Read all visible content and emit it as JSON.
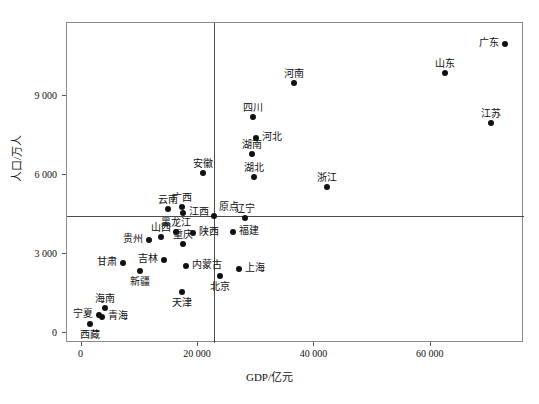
{
  "chart_data": {
    "type": "scatter",
    "title": "",
    "xlabel": "GDP/亿元",
    "ylabel": "人口/万人",
    "xlim": [
      -2500,
      76000
    ],
    "ylim": [
      -400,
      11800
    ],
    "xticks": [
      0,
      20000,
      40000,
      60000
    ],
    "xticklabels": [
      "0",
      "20 000",
      "40 000",
      "60 000"
    ],
    "yticks": [
      0,
      3000,
      6000,
      9000
    ],
    "yticklabels": [
      "0",
      "3 000",
      "6 000",
      "9 000"
    ],
    "grid": false,
    "legend": null,
    "reference_lines": {
      "vertical_x": 22800,
      "horizontal_y": 4450,
      "origin_label": "原点"
    },
    "points": [
      {
        "name": "广东",
        "x": 72800,
        "y": 11000,
        "label_pos": "left"
      },
      {
        "name": "山东",
        "x": 62500,
        "y": 9880,
        "label_pos": "top"
      },
      {
        "name": "江苏",
        "x": 70400,
        "y": 7990,
        "label_pos": "top"
      },
      {
        "name": "河南",
        "x": 36500,
        "y": 9520,
        "label_pos": "top"
      },
      {
        "name": "四川",
        "x": 29500,
        "y": 8220,
        "label_pos": "top"
      },
      {
        "name": "河北",
        "x": 29900,
        "y": 7400,
        "label_pos": "right"
      },
      {
        "name": "湖南",
        "x": 29300,
        "y": 6820,
        "label_pos": "top"
      },
      {
        "name": "湖北",
        "x": 29600,
        "y": 5920,
        "label_pos": "top"
      },
      {
        "name": "浙江",
        "x": 42200,
        "y": 5540,
        "label_pos": "top"
      },
      {
        "name": "安徽",
        "x": 20800,
        "y": 6100,
        "label_pos": "top"
      },
      {
        "name": "云南",
        "x": 14800,
        "y": 4710,
        "label_pos": "top"
      },
      {
        "name": "广西",
        "x": 17200,
        "y": 4800,
        "label_pos": "top"
      },
      {
        "name": "江西",
        "x": 17400,
        "y": 4560,
        "label_pos": "right"
      },
      {
        "name": "辽宁",
        "x": 28000,
        "y": 4380,
        "label_pos": "top"
      },
      {
        "name": "福建",
        "x": 26000,
        "y": 3840,
        "label_pos": "right"
      },
      {
        "name": "陕西",
        "x": 19200,
        "y": 3810,
        "label_pos": "right"
      },
      {
        "name": "黑龙江",
        "x": 16300,
        "y": 3830,
        "label_pos": "top"
      },
      {
        "name": "山西",
        "x": 13700,
        "y": 3660,
        "label_pos": "top"
      },
      {
        "name": "贵州",
        "x": 11500,
        "y": 3530,
        "label_pos": "left"
      },
      {
        "name": "重庆",
        "x": 17500,
        "y": 3370,
        "label_pos": "top"
      },
      {
        "name": "吉林",
        "x": 14200,
        "y": 2750,
        "label_pos": "left"
      },
      {
        "name": "内蒙古",
        "x": 17900,
        "y": 2530,
        "label_pos": "right"
      },
      {
        "name": "甘肃",
        "x": 7200,
        "y": 2640,
        "label_pos": "left"
      },
      {
        "name": "新疆",
        "x": 10100,
        "y": 2360,
        "label_pos": "bottom"
      },
      {
        "name": "上海",
        "x": 27000,
        "y": 2420,
        "label_pos": "right"
      },
      {
        "name": "北京",
        "x": 23800,
        "y": 2170,
        "label_pos": "bottom"
      },
      {
        "name": "天津",
        "x": 17200,
        "y": 1560,
        "label_pos": "bottom"
      },
      {
        "name": "海南",
        "x": 4100,
        "y": 920,
        "label_pos": "top"
      },
      {
        "name": "宁夏",
        "x": 3000,
        "y": 680,
        "label_pos": "left"
      },
      {
        "name": "青海",
        "x": 3500,
        "y": 600,
        "label_pos": "right"
      },
      {
        "name": "西藏",
        "x": 1400,
        "y": 340,
        "label_pos": "bottom"
      }
    ]
  },
  "axes": {
    "x_label": "GDP/亿元",
    "y_label": "人口/万人"
  }
}
